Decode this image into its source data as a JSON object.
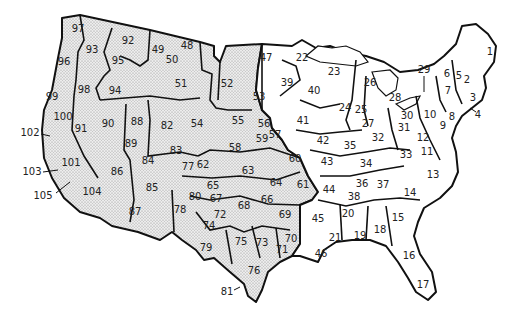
{
  "map": {
    "title": "United States numbered regions",
    "fill_colors": {
      "western_stippled": "#e6e6e6",
      "eastern_plain": "#ffffff",
      "border": "#111111"
    },
    "regions": [
      {
        "id": "1",
        "x": 490,
        "y": 52,
        "shaded": false
      },
      {
        "id": "2",
        "x": 467,
        "y": 80,
        "shaded": false
      },
      {
        "id": "3",
        "x": 473,
        "y": 98,
        "shaded": false
      },
      {
        "id": "4",
        "x": 478,
        "y": 115,
        "shaded": false,
        "label_outside": true
      },
      {
        "id": "5",
        "x": 459,
        "y": 76,
        "shaded": false
      },
      {
        "id": "6",
        "x": 447,
        "y": 74,
        "shaded": false
      },
      {
        "id": "7",
        "x": 448,
        "y": 91,
        "shaded": false
      },
      {
        "id": "8",
        "x": 452,
        "y": 117,
        "shaded": false
      },
      {
        "id": "9",
        "x": 443,
        "y": 126,
        "shaded": false
      },
      {
        "id": "10",
        "x": 430,
        "y": 115,
        "shaded": false
      },
      {
        "id": "11",
        "x": 427,
        "y": 152,
        "shaded": false
      },
      {
        "id": "12",
        "x": 423,
        "y": 138,
        "shaded": false
      },
      {
        "id": "13",
        "x": 433,
        "y": 175,
        "shaded": false
      },
      {
        "id": "14",
        "x": 410,
        "y": 193,
        "shaded": false
      },
      {
        "id": "15",
        "x": 398,
        "y": 218,
        "shaded": false
      },
      {
        "id": "16",
        "x": 409,
        "y": 256,
        "shaded": false
      },
      {
        "id": "17",
        "x": 423,
        "y": 285,
        "shaded": false
      },
      {
        "id": "18",
        "x": 380,
        "y": 230,
        "shaded": false
      },
      {
        "id": "19",
        "x": 360,
        "y": 236,
        "shaded": false
      },
      {
        "id": "20",
        "x": 348,
        "y": 214,
        "shaded": false
      },
      {
        "id": "21",
        "x": 335,
        "y": 238,
        "shaded": false
      },
      {
        "id": "22",
        "x": 302,
        "y": 58,
        "shaded": false
      },
      {
        "id": "23",
        "x": 334,
        "y": 72,
        "shaded": false
      },
      {
        "id": "24",
        "x": 345,
        "y": 108,
        "shaded": false
      },
      {
        "id": "25",
        "x": 361,
        "y": 110,
        "shaded": false
      },
      {
        "id": "26",
        "x": 370,
        "y": 83,
        "shaded": false
      },
      {
        "id": "27",
        "x": 368,
        "y": 124,
        "shaded": false
      },
      {
        "id": "28",
        "x": 395,
        "y": 98,
        "shaded": false
      },
      {
        "id": "29",
        "x": 424,
        "y": 70,
        "shaded": false,
        "label_outside": true
      },
      {
        "id": "30",
        "x": 407,
        "y": 116,
        "shaded": false
      },
      {
        "id": "31",
        "x": 404,
        "y": 128,
        "shaded": false
      },
      {
        "id": "32",
        "x": 378,
        "y": 138,
        "shaded": false
      },
      {
        "id": "33",
        "x": 406,
        "y": 155,
        "shaded": false
      },
      {
        "id": "34",
        "x": 366,
        "y": 164,
        "shaded": false
      },
      {
        "id": "35",
        "x": 350,
        "y": 146,
        "shaded": false
      },
      {
        "id": "36",
        "x": 362,
        "y": 184,
        "shaded": false
      },
      {
        "id": "37",
        "x": 383,
        "y": 185,
        "shaded": false
      },
      {
        "id": "38",
        "x": 354,
        "y": 197,
        "shaded": false
      },
      {
        "id": "39",
        "x": 287,
        "y": 83,
        "shaded": false
      },
      {
        "id": "40",
        "x": 314,
        "y": 91,
        "shaded": false
      },
      {
        "id": "41",
        "x": 303,
        "y": 121,
        "shaded": false
      },
      {
        "id": "42",
        "x": 323,
        "y": 141,
        "shaded": false
      },
      {
        "id": "43",
        "x": 327,
        "y": 162,
        "shaded": false
      },
      {
        "id": "44",
        "x": 329,
        "y": 190,
        "shaded": false
      },
      {
        "id": "45",
        "x": 318,
        "y": 219,
        "shaded": false
      },
      {
        "id": "46",
        "x": 321,
        "y": 254,
        "shaded": false
      },
      {
        "id": "47",
        "x": 266,
        "y": 58,
        "shaded": false
      },
      {
        "id": "48",
        "x": 187,
        "y": 46,
        "shaded": true
      },
      {
        "id": "49",
        "x": 158,
        "y": 50,
        "shaded": true
      },
      {
        "id": "50",
        "x": 172,
        "y": 60,
        "shaded": true
      },
      {
        "id": "51",
        "x": 181,
        "y": 84,
        "shaded": true
      },
      {
        "id": "52",
        "x": 227,
        "y": 84,
        "shaded": true
      },
      {
        "id": "53",
        "x": 259,
        "y": 97,
        "shaded": true
      },
      {
        "id": "54",
        "x": 197,
        "y": 124,
        "shaded": true
      },
      {
        "id": "55",
        "x": 238,
        "y": 121,
        "shaded": true
      },
      {
        "id": "56",
        "x": 264,
        "y": 124,
        "shaded": true
      },
      {
        "id": "57",
        "x": 275,
        "y": 135,
        "shaded": true
      },
      {
        "id": "58",
        "x": 235,
        "y": 148,
        "shaded": true
      },
      {
        "id": "59",
        "x": 262,
        "y": 139,
        "shaded": true
      },
      {
        "id": "60",
        "x": 295,
        "y": 159,
        "shaded": true
      },
      {
        "id": "61",
        "x": 303,
        "y": 185,
        "shaded": true
      },
      {
        "id": "62",
        "x": 203,
        "y": 165,
        "shaded": true
      },
      {
        "id": "63",
        "x": 248,
        "y": 171,
        "shaded": true
      },
      {
        "id": "64",
        "x": 276,
        "y": 183,
        "shaded": true
      },
      {
        "id": "65",
        "x": 213,
        "y": 186,
        "shaded": true
      },
      {
        "id": "66",
        "x": 267,
        "y": 200,
        "shaded": true
      },
      {
        "id": "67",
        "x": 216,
        "y": 199,
        "shaded": true
      },
      {
        "id": "68",
        "x": 244,
        "y": 206,
        "shaded": true
      },
      {
        "id": "69",
        "x": 285,
        "y": 215,
        "shaded": true
      },
      {
        "id": "70",
        "x": 291,
        "y": 239,
        "shaded": true
      },
      {
        "id": "71",
        "x": 282,
        "y": 250,
        "shaded": true
      },
      {
        "id": "72",
        "x": 220,
        "y": 215,
        "shaded": true
      },
      {
        "id": "73",
        "x": 262,
        "y": 243,
        "shaded": true
      },
      {
        "id": "74",
        "x": 209,
        "y": 226,
        "shaded": true
      },
      {
        "id": "75",
        "x": 241,
        "y": 242,
        "shaded": true
      },
      {
        "id": "76",
        "x": 254,
        "y": 271,
        "shaded": true
      },
      {
        "id": "77",
        "x": 188,
        "y": 167,
        "shaded": true
      },
      {
        "id": "78",
        "x": 180,
        "y": 210,
        "shaded": true
      },
      {
        "id": "79",
        "x": 206,
        "y": 248,
        "shaded": true
      },
      {
        "id": "80",
        "x": 195,
        "y": 197,
        "shaded": true
      },
      {
        "id": "81",
        "x": 227,
        "y": 292,
        "shaded": true,
        "label_outside": true
      },
      {
        "id": "82",
        "x": 167,
        "y": 126,
        "shaded": true
      },
      {
        "id": "83",
        "x": 176,
        "y": 151,
        "shaded": true
      },
      {
        "id": "84",
        "x": 148,
        "y": 161,
        "shaded": true
      },
      {
        "id": "85",
        "x": 152,
        "y": 188,
        "shaded": true
      },
      {
        "id": "86",
        "x": 117,
        "y": 172,
        "shaded": true
      },
      {
        "id": "87",
        "x": 135,
        "y": 212,
        "shaded": true
      },
      {
        "id": "88",
        "x": 137,
        "y": 122,
        "shaded": true
      },
      {
        "id": "89",
        "x": 131,
        "y": 144,
        "shaded": true
      },
      {
        "id": "90",
        "x": 108,
        "y": 124,
        "shaded": true
      },
      {
        "id": "91",
        "x": 81,
        "y": 129,
        "shaded": true
      },
      {
        "id": "92",
        "x": 128,
        "y": 41,
        "shaded": true
      },
      {
        "id": "93",
        "x": 92,
        "y": 50,
        "shaded": true
      },
      {
        "id": "94",
        "x": 115,
        "y": 91,
        "shaded": true
      },
      {
        "id": "95",
        "x": 118,
        "y": 61,
        "shaded": true
      },
      {
        "id": "96",
        "x": 64,
        "y": 62,
        "shaded": true
      },
      {
        "id": "97",
        "x": 78,
        "y": 29,
        "shaded": true
      },
      {
        "id": "98",
        "x": 84,
        "y": 90,
        "shaded": true
      },
      {
        "id": "99",
        "x": 52,
        "y": 97,
        "shaded": true
      },
      {
        "id": "100",
        "x": 63,
        "y": 117,
        "shaded": true
      },
      {
        "id": "101",
        "x": 71,
        "y": 163,
        "shaded": true
      },
      {
        "id": "102",
        "x": 30,
        "y": 133,
        "shaded": true,
        "label_outside": true
      },
      {
        "id": "103",
        "x": 32,
        "y": 172,
        "shaded": true,
        "label_outside": true
      },
      {
        "id": "104",
        "x": 92,
        "y": 192,
        "shaded": true
      },
      {
        "id": "105",
        "x": 43,
        "y": 196,
        "shaded": true,
        "label_outside": true
      }
    ]
  }
}
